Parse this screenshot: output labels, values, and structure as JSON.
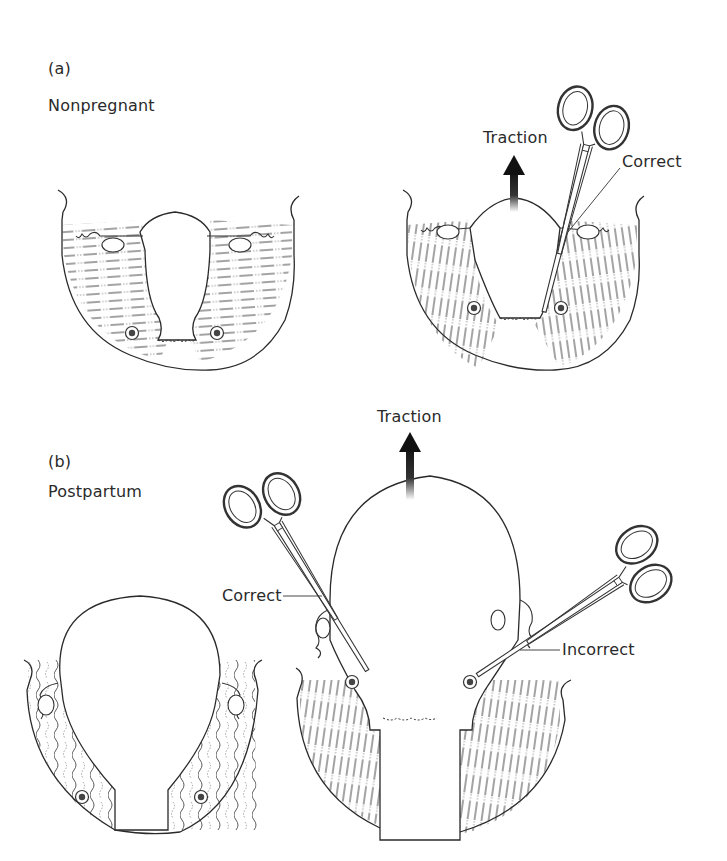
{
  "panel_a": {
    "letter": "(a)",
    "title": "Nonpregnant",
    "traction_label": "Traction",
    "clamp_label": "Correct"
  },
  "panel_b": {
    "letter": "(b)",
    "title": "Postpartum",
    "traction_label": "Traction",
    "correct_label": "Correct",
    "incorrect_label": "Incorrect"
  },
  "colors": {
    "line": "#2a2a2a",
    "background": "#ffffff",
    "arrow": "#111111"
  }
}
